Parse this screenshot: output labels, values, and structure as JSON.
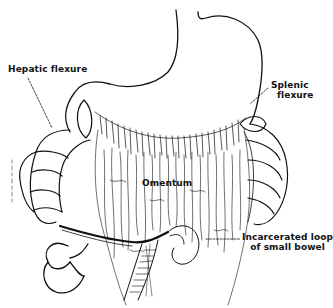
{
  "figure": {
    "type": "anatomical line drawing",
    "ink_color": "#111111",
    "background_color": "#ffffff"
  },
  "labels": {
    "hepatic_flexure": "Hepatic flexure",
    "splenic_flexure_line1": "Splenic",
    "splenic_flexure_line2": "flexure",
    "omentum": "Omentum",
    "incarcerated_line1": "Incarcerated loop",
    "incarcerated_line2": "of small bowel"
  },
  "structures": [
    {
      "name": "stomach"
    },
    {
      "name": "transverse colon"
    },
    {
      "name": "hepatic flexure"
    },
    {
      "name": "splenic flexure"
    },
    {
      "name": "ascending colon"
    },
    {
      "name": "descending colon"
    },
    {
      "name": "greater omentum"
    },
    {
      "name": "small bowel loops"
    },
    {
      "name": "incarcerated small bowel loop"
    }
  ]
}
